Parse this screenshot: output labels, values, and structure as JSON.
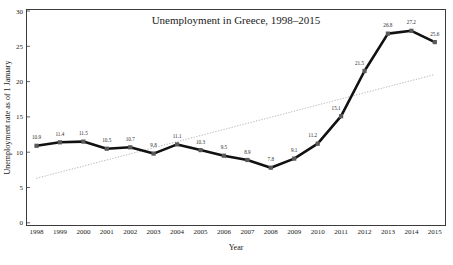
{
  "chart_data": {
    "type": "line",
    "title": "Unemployment in Greece, 1998–2015",
    "xlabel": "Year",
    "ylabel": "Unemployment rate as of 1 January",
    "categories": [
      "1998",
      "1999",
      "2000",
      "2001",
      "2002",
      "2003",
      "2004",
      "2005",
      "2006",
      "2007",
      "2008",
      "2009",
      "2010",
      "2011",
      "2012",
      "2013",
      "2014",
      "2015"
    ],
    "x": [
      1998,
      1999,
      2000,
      2001,
      2002,
      2003,
      2004,
      2005,
      2006,
      2007,
      2008,
      2009,
      2010,
      2011,
      2012,
      2013,
      2014,
      2015
    ],
    "values": [
      10.9,
      11.4,
      11.5,
      10.5,
      10.7,
      9.8,
      11.1,
      10.3,
      9.5,
      8.9,
      7.8,
      9.1,
      11.2,
      15.1,
      21.5,
      26.8,
      27.2,
      25.6
    ],
    "data_labels": [
      "10.9",
      "11.4",
      "11.5",
      "10.5",
      "10.7",
      "9.8",
      "11.1",
      "10.3",
      "9.5",
      "8.9",
      "7.8",
      "9.1",
      "11.2",
      "15.1",
      "21.5",
      "26.8",
      "27.2",
      "25.6"
    ],
    "ylim": [
      0,
      30
    ],
    "yticks": [
      0,
      5,
      10,
      15,
      20,
      25,
      30
    ],
    "ytick_labels": [
      "0",
      "5",
      "10",
      "15",
      "20",
      "25",
      "30"
    ],
    "grid": false,
    "legend": "none",
    "series": [
      {
        "name": "Unemployment rate",
        "style": "solid",
        "color": "#111111",
        "markers": true,
        "values": [
          10.9,
          11.4,
          11.5,
          10.5,
          10.7,
          9.8,
          11.1,
          10.3,
          9.5,
          8.9,
          7.8,
          9.1,
          11.2,
          15.1,
          21.5,
          26.8,
          27.2,
          25.6
        ]
      },
      {
        "name": "Linear trendline",
        "style": "dotted",
        "color": "#b4b4b4",
        "markers": false,
        "endpoints": [
          6.3,
          21.0
        ]
      }
    ]
  },
  "figure": {
    "border_color": "#3c3c3c",
    "background": "#ffffff"
  }
}
